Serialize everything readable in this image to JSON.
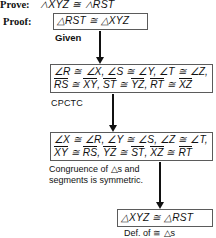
{
  "figure": {
    "type": "flow-proof-diagram",
    "prove": {
      "label": "Prove:",
      "statement": "△XYZ ≅ △RST"
    },
    "proof_label": "Proof:"
  },
  "boxes": [
    {
      "id": "box1",
      "lines": [
        {
          "plain": "△RST ≅ △XYZ"
        }
      ]
    },
    {
      "id": "box2",
      "lines": [
        {
          "plain": "∠R ≅ ∠X, ∠S ≅ ∠Y, ∠T ≅ ∠Z,"
        },
        {
          "segments": [
            "RS",
            "≅",
            "XY",
            ",",
            "ST",
            "≅",
            "YZ",
            ",",
            "RT",
            "≅",
            "XZ"
          ]
        }
      ]
    },
    {
      "id": "box3",
      "lines": [
        {
          "plain": "∠X ≅ ∠R, ∠Y ≅ ∠S, ∠Z ≅ ∠T,"
        },
        {
          "segments": [
            "XY",
            "≅",
            "RS",
            ",",
            "YZ",
            "≅",
            "ST",
            ",",
            "XZ",
            "≅",
            "RT"
          ]
        }
      ]
    },
    {
      "id": "box4",
      "lines": [
        {
          "plain": "△XYZ ≅ △RST"
        }
      ]
    }
  ],
  "reasons": {
    "given": "Given",
    "cpctc": "CPCTC",
    "symmetric_line1": "Congruence of △s and",
    "symmetric_line2": "segments is symmetric.",
    "definition": "Def. of ≅ △s"
  },
  "box1_text": "△RST ≅ △XYZ",
  "box2_line1": "∠R ≅ ∠X, ∠S ≅ ∠Y, ∠T ≅ ∠Z,",
  "box3_line1": "∠X ≅ ∠R, ∠Y ≅ ∠S, ∠Z ≅ ∠T,",
  "box4_text": "△XYZ ≅ △RST",
  "segments": {
    "b2": {
      "s1": "RS",
      "s2": "XY",
      "s3": "ST",
      "s4": "YZ",
      "s5": "RT",
      "s6": "XZ"
    },
    "b3": {
      "s1": "XY",
      "s2": "RS",
      "s3": "YZ",
      "s4": "ST",
      "s5": "XZ",
      "s6": "RT"
    }
  },
  "symbols": {
    "congruent": "≅",
    "comma": ",",
    "triangle": "△"
  },
  "colors": {
    "ink": "#111111",
    "box_border": "#5b5b5b",
    "background": "#ffffff"
  }
}
